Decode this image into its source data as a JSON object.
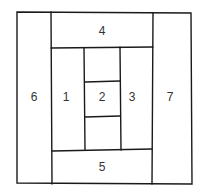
{
  "diagram": {
    "type": "quilt-block-layout",
    "line_color": "#1a1a1a",
    "pieces": [
      {
        "id": "1",
        "label": "1",
        "x": 66,
        "y": 97
      },
      {
        "id": "2",
        "label": "2",
        "x": 102,
        "y": 97
      },
      {
        "id": "3",
        "label": "3",
        "x": 132,
        "y": 97
      },
      {
        "id": "4",
        "label": "4",
        "x": 102,
        "y": 31
      },
      {
        "id": "5",
        "label": "5",
        "x": 102,
        "y": 167
      },
      {
        "id": "6",
        "label": "6",
        "x": 34,
        "y": 97
      },
      {
        "id": "7",
        "label": "7",
        "x": 170,
        "y": 97
      }
    ]
  }
}
